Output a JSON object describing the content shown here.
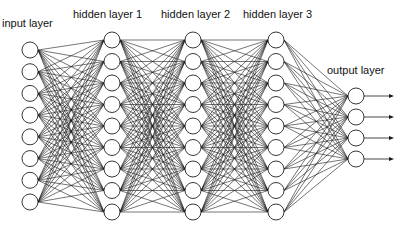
{
  "diagram": {
    "colors": {
      "edge": "#1a1a1a",
      "node_fill": "#ffffff",
      "node_stroke": "#222222",
      "text": "#111111"
    },
    "layers": [
      {
        "id": "input",
        "label": "input layer",
        "nodes": 8,
        "x": 30,
        "y_top": 50,
        "y_bottom": 202,
        "label_x": 2,
        "label_y": 17
      },
      {
        "id": "hidden1",
        "label": "hidden layer 1",
        "nodes": 9,
        "x": 112,
        "y_top": 40,
        "y_bottom": 212,
        "label_x": 73,
        "label_y": 8
      },
      {
        "id": "hidden2",
        "label": "hidden layer 2",
        "nodes": 9,
        "x": 193,
        "y_top": 40,
        "y_bottom": 212,
        "label_x": 161,
        "label_y": 8
      },
      {
        "id": "hidden3",
        "label": "hidden layer 3",
        "nodes": 9,
        "x": 276,
        "y_top": 40,
        "y_bottom": 212,
        "label_x": 243,
        "label_y": 8
      },
      {
        "id": "output",
        "label": "output layer",
        "nodes": 4,
        "x": 356,
        "y_top": 96,
        "y_bottom": 159,
        "label_x": 327,
        "label_y": 64
      }
    ],
    "node_radius": 8,
    "output_arrow_end_x": 394
  }
}
